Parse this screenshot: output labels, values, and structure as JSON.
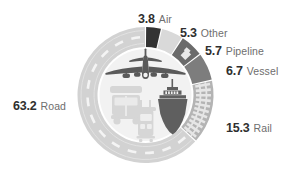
{
  "chart_data": {
    "type": "pie",
    "title": "",
    "subtitle": "",
    "xlabel": "",
    "ylabel": "",
    "unit": "percent",
    "legend_position": "around-ring",
    "grid": false,
    "categories": [
      "Road",
      "Rail",
      "Vessel",
      "Pipeline",
      "Other",
      "Air"
    ],
    "values": [
      63.2,
      15.3,
      6.7,
      5.7,
      5.3,
      3.8
    ],
    "slices": [
      {
        "label": "Road",
        "value": 63.2,
        "value_text": "63.2",
        "color": "#d2d2d2",
        "texture": "road-dashes"
      },
      {
        "label": "Rail",
        "value": 15.3,
        "value_text": "15.3",
        "color": "#b4b4b4",
        "texture": "rail-ties"
      },
      {
        "label": "Vessel",
        "value": 6.7,
        "value_text": "6.7",
        "color": "#7d7d7d",
        "texture": "none"
      },
      {
        "label": "Pipeline",
        "value": 5.7,
        "value_text": "5.7",
        "color": "#6b6b6b",
        "texture": "pipe-zigzag"
      },
      {
        "label": "Other",
        "value": 5.3,
        "value_text": "5.3",
        "color": "#d9d9d9",
        "texture": "none"
      },
      {
        "label": "Air",
        "value": 3.8,
        "value_text": "3.8",
        "color": "#333333",
        "texture": "none"
      }
    ]
  },
  "labels": {
    "air": {
      "value": "3.8",
      "name": "Air"
    },
    "other": {
      "value": "5.3",
      "name": "Other"
    },
    "pipeline": {
      "value": "5.7",
      "name": "Pipeline"
    },
    "vessel": {
      "value": "6.7",
      "name": "Vessel"
    },
    "rail": {
      "value": "15.3",
      "name": "Rail"
    },
    "road": {
      "value": "63.2",
      "name": "Road"
    }
  },
  "icons": [
    {
      "name": "airplane-icon",
      "color": "#5a5a5a"
    },
    {
      "name": "truck-icon",
      "color": "#d5d5d5"
    },
    {
      "name": "train-icon",
      "color": "#d5d5d5"
    },
    {
      "name": "ship-icon",
      "color": "#5f5f5f"
    }
  ],
  "colors": {
    "value_text": "#2f2f2f",
    "category_text": "#6e6e6e",
    "background": "#ffffff",
    "inner_disc": "#f2f2f2"
  }
}
